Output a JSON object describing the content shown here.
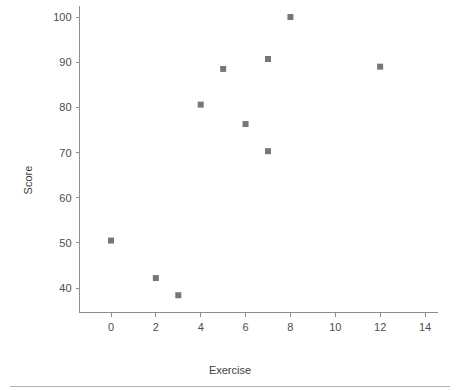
{
  "chart_data": {
    "type": "scatter",
    "title": "",
    "xlabel": "Exercise",
    "ylabel": "Score",
    "xlim": [
      -1.4,
      14.6
    ],
    "ylim": [
      34.5,
      102.5
    ],
    "xticks": [
      0,
      2,
      4,
      6,
      8,
      10,
      12,
      14
    ],
    "xtick_labels": [
      "0",
      "2",
      "4",
      "6",
      "8",
      "10",
      "12",
      "14"
    ],
    "yticks": [
      40,
      50,
      60,
      70,
      80,
      90,
      100
    ],
    "ytick_labels": [
      "40",
      "50",
      "60",
      "70",
      "80",
      "90",
      "100"
    ],
    "grid": false,
    "legend": null,
    "marker": "square",
    "marker_color": "#777777",
    "marker_size": 6,
    "points": [
      {
        "x": 0,
        "y": 50.5
      },
      {
        "x": 2,
        "y": 42.2
      },
      {
        "x": 3,
        "y": 38.4
      },
      {
        "x": 4,
        "y": 80.6
      },
      {
        "x": 5,
        "y": 88.5
      },
      {
        "x": 6,
        "y": 76.3
      },
      {
        "x": 7,
        "y": 90.7
      },
      {
        "x": 7,
        "y": 70.3
      },
      {
        "x": 8,
        "y": 100.0
      },
      {
        "x": 12,
        "y": 89.0
      }
    ]
  },
  "figure": {
    "axis_color": "#8c8c8c",
    "tick_label_color": "#4d4d4d",
    "axis_title_color": "#3d3d3d",
    "footer_rule_color": "#b0b0b0",
    "background": "#ffffff"
  }
}
